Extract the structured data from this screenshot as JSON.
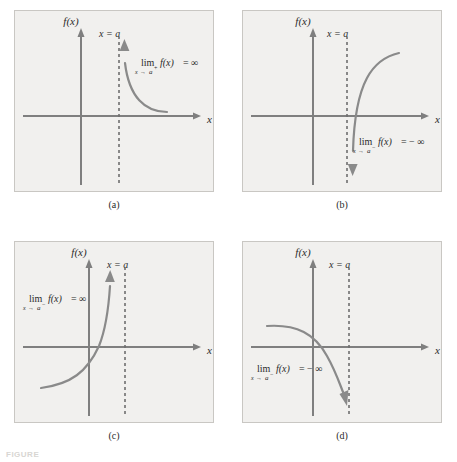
{
  "figure": {
    "label": "FIGURE",
    "axis_y_label": "f(x)",
    "axis_x_label": "x",
    "asymptote_label": "x = a",
    "infinity": "∞",
    "neg_infinity": "− ∞",
    "lim_word": "lim",
    "arrow": "→",
    "func": "f(x)",
    "equals": "="
  },
  "colors": {
    "panel_background": "#f1f0ee",
    "panel_border": "#c9c7c3",
    "axis": "#7f7f7f",
    "curve": "#8a8a8a",
    "asymptote": "#6f6f6f",
    "text": "#2b2b2b",
    "page_background": "#ffffff"
  },
  "panels": [
    {
      "id": "a",
      "caption": "(a)",
      "limit": {
        "lim": "lim",
        "sub_var": "x",
        "sub_arrow": "→",
        "sub_point": "a",
        "sub_sign": "+",
        "func": "f(x)",
        "equals": "=",
        "value": "∞"
      },
      "limit_text": "lim x→a⁺ f(x) = ∞",
      "description": "Curve approaches vertical asymptote x = a from the right and rises to positive infinity.",
      "approach_side": "right",
      "direction": "up",
      "asymptote_label": "x = a",
      "axis_y_label": "f(x)",
      "axis_x_label": "x"
    },
    {
      "id": "b",
      "caption": "(b)",
      "limit": {
        "lim": "lim",
        "sub_var": "x",
        "sub_arrow": "→",
        "sub_point": "a",
        "sub_sign": "−",
        "func": "f(x)",
        "equals": "=",
        "value": "− ∞"
      },
      "limit_text": "lim x→a⁻ f(x) = − ∞",
      "description": "Curve descends along the vertical asymptote x = a to negative infinity.",
      "approach_side": "right",
      "direction": "down",
      "asymptote_label": "x = a",
      "axis_y_label": "f(x)",
      "axis_x_label": "x"
    },
    {
      "id": "c",
      "caption": "(c)",
      "limit": {
        "lim": "lim",
        "sub_var": "x",
        "sub_arrow": "→",
        "sub_point": "a",
        "sub_sign": "−",
        "func": "f(x)",
        "equals": "=",
        "value": "∞"
      },
      "limit_text": "lim x→a⁻ f(x) = ∞",
      "description": "Curve rises from lower left through the origin and up to positive infinity on the left of x = a.",
      "approach_side": "left",
      "direction": "up",
      "asymptote_label": "x = a",
      "axis_y_label": "f(x)",
      "axis_x_label": "x"
    },
    {
      "id": "d",
      "caption": "(d)",
      "limit": {
        "lim": "lim",
        "sub_var": "x",
        "sub_arrow": "→",
        "sub_point": "a",
        "sub_sign": "−",
        "func": "f(x)",
        "equals": "=",
        "value": "− ∞"
      },
      "limit_text": "lim x→a⁻ f(x) = − ∞",
      "description": "Curve falls from upper left across the x-axis down to negative infinity on the left of x = a.",
      "approach_side": "left",
      "direction": "down",
      "asymptote_label": "x = a",
      "axis_y_label": "f(x)",
      "axis_x_label": "x"
    }
  ]
}
